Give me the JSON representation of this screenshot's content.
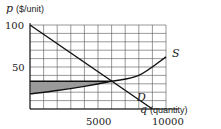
{
  "chart_data": {
    "type": "line",
    "title": "",
    "xlabel": "q (quantity)",
    "ylabel": "p ($/unit)",
    "xlabel_var": "q",
    "xlabel_unit": "(quantity)",
    "ylabel_var": "p",
    "ylabel_unit": "($/unit)",
    "xlim": [
      0,
      10000
    ],
    "ylim": [
      0,
      100
    ],
    "x_ticks": [
      5000,
      10000
    ],
    "y_ticks": [
      50,
      100
    ],
    "y_tick_labels": [
      "50",
      "100"
    ],
    "x_tick_labels": [
      "5000",
      "10000"
    ],
    "grid": true,
    "grid_x_step": 1000,
    "grid_y_step": 10,
    "series": [
      {
        "name": "D",
        "label": "D",
        "x": [
          0,
          6000,
          9000
        ],
        "values": [
          100,
          33,
          0
        ]
      },
      {
        "name": "S",
        "label": "S",
        "x": [
          0,
          2000,
          4000,
          6000,
          8000,
          10000
        ],
        "values": [
          18,
          22,
          27,
          33,
          40,
          62
        ]
      }
    ],
    "equilibrium": {
      "q": 6000,
      "p": 33
    },
    "shaded_region": {
      "description": "Producer surplus: between horizontal price line p=33 and supply curve S, from q=0 to q=6000",
      "price_level": 33,
      "q_range": [
        0,
        6000
      ],
      "fill": "#9a9a9a"
    },
    "price_line": {
      "p": 33,
      "q_range": [
        0,
        6000
      ]
    }
  }
}
